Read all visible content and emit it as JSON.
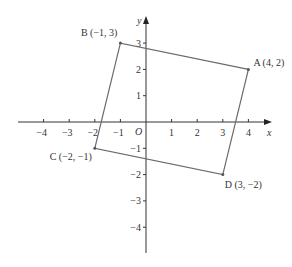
{
  "figure": {
    "type": "coordinate-plane-quadrilateral",
    "axes": {
      "x_label": "x",
      "y_label": "y",
      "origin_label": "O",
      "x_ticks": [
        -4,
        -3,
        -2,
        -1,
        1,
        2,
        3,
        4
      ],
      "y_ticks": [
        3,
        2,
        1,
        -1,
        -2,
        -3,
        -4
      ],
      "x_tick_labels": [
        "−4",
        "−3",
        "−2",
        "−1",
        "1",
        "2",
        "3",
        "4"
      ],
      "y_tick_labels": [
        "3",
        "2",
        "1",
        "−1",
        "−2",
        "−3",
        "−4"
      ]
    },
    "points": [
      {
        "name": "A",
        "x": 4,
        "y": 2,
        "label": "A (4, 2)"
      },
      {
        "name": "B",
        "x": -1,
        "y": 3,
        "label": "B (−1, 3)"
      },
      {
        "name": "C",
        "x": -2,
        "y": -1,
        "label": "C (−2, −1)"
      },
      {
        "name": "D",
        "x": 3,
        "y": -2,
        "label": "D (3, −2)"
      }
    ],
    "polygon_order": [
      "A",
      "B",
      "C",
      "D"
    ],
    "colors": {
      "axis": "#333333",
      "polygon": "#6b6b6b",
      "text": "#333333"
    }
  }
}
